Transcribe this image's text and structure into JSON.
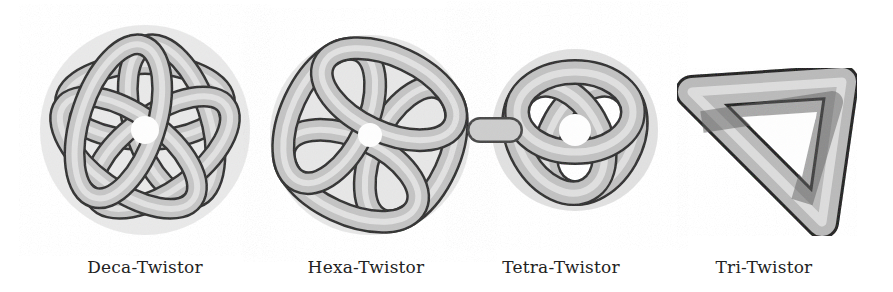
{
  "figure": {
    "knots": [
      {
        "label": "Deca-Twistor",
        "symmetry": 5,
        "cx": 145,
        "cy": 130
      },
      {
        "label": "Hexa-Twistor",
        "symmetry": 4,
        "cx": 370,
        "cy": 135
      },
      {
        "label": "Tetra-Twistor",
        "symmetry": 3,
        "cx": 575,
        "cy": 130
      },
      {
        "label": "Tri-Twistor",
        "symmetry": 3,
        "cx": 772,
        "cy": 130
      }
    ],
    "colors": {
      "background": "#ffffff",
      "tube_light": "#e8e8e8",
      "tube_mid": "#a8a8a8",
      "tube_dark": "#3a3a3a",
      "caption": "#222222"
    }
  }
}
